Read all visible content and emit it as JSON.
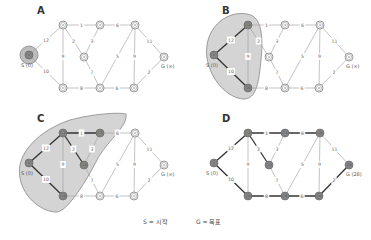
{
  "legend": {
    "start": "S = 시작",
    "goal": "G = 목표"
  },
  "graph": {
    "nodes": [
      {
        "id": "S"
      },
      {
        "id": "N1"
      },
      {
        "id": "N2"
      },
      {
        "id": "N3"
      },
      {
        "id": "M"
      },
      {
        "id": "B1"
      },
      {
        "id": "B2"
      },
      {
        "id": "B3"
      },
      {
        "id": "G"
      }
    ],
    "edges": [
      {
        "from": "S",
        "to": "N1",
        "weight": "12"
      },
      {
        "from": "S",
        "to": "B1",
        "weight": "10"
      },
      {
        "from": "N1",
        "to": "N2",
        "weight": "1"
      },
      {
        "from": "N2",
        "to": "N3",
        "weight": "6"
      },
      {
        "from": "N1",
        "to": "M",
        "weight": "2"
      },
      {
        "from": "N2",
        "to": "M",
        "weight": "3"
      },
      {
        "from": "N1",
        "to": "B1",
        "weight": "9"
      },
      {
        "from": "M",
        "to": "B2",
        "weight": "7"
      },
      {
        "from": "B1",
        "to": "B2",
        "weight": "8"
      },
      {
        "from": "B2",
        "to": "N3",
        "weight": "5"
      },
      {
        "from": "B2",
        "to": "B3",
        "weight": "6"
      },
      {
        "from": "N3",
        "to": "B3",
        "weight": "9"
      },
      {
        "from": "N3",
        "to": "G",
        "weight": "11"
      },
      {
        "from": "B3",
        "to": "G",
        "weight": "2"
      }
    ]
  },
  "panels": [
    {
      "id": "A",
      "label": "A",
      "start_label": "S (0)",
      "goal_label": "G (∞)",
      "node_inner": {
        "S": "0",
        "N1": "∞",
        "N2": "∞",
        "N3": "∞",
        "M": "∞",
        "B1": "∞",
        "B2": "∞",
        "B3": "∞",
        "G": "∞"
      },
      "visited": [
        "S"
      ],
      "bold_edges": [],
      "boxed_edges": [],
      "region": "small"
    },
    {
      "id": "B",
      "label": "B",
      "start_label": "S (0)",
      "goal_label": "G (∞)",
      "node_inner": {
        "S": "0",
        "N1": "12",
        "N2": "∞",
        "N3": "∞",
        "M": "∞",
        "B1": "10",
        "B2": "∞",
        "B3": "∞",
        "G": "∞"
      },
      "visited": [
        "S",
        "N1",
        "B1"
      ],
      "bold_edges": [
        [
          "S",
          "N1"
        ],
        [
          "S",
          "B1"
        ]
      ],
      "boxed_edges": [
        [
          "S",
          "N1"
        ],
        [
          "S",
          "B1"
        ],
        [
          "N1",
          "B1"
        ],
        [
          "N1",
          "M"
        ]
      ],
      "region": "medium"
    },
    {
      "id": "C",
      "label": "C",
      "start_label": "S (0)",
      "goal_label": "G (∞)",
      "node_inner": {
        "S": "0",
        "N1": "12",
        "N2": "13",
        "N3": "∞",
        "M": "14",
        "B1": "10",
        "B2": "∞",
        "B3": "∞",
        "G": "∞"
      },
      "visited": [
        "S",
        "N1",
        "N2",
        "M",
        "B1"
      ],
      "bold_edges": [
        [
          "S",
          "N1"
        ],
        [
          "S",
          "B1"
        ],
        [
          "N1",
          "N2"
        ],
        [
          "N1",
          "M"
        ]
      ],
      "boxed_edges": [
        [
          "S",
          "N1"
        ],
        [
          "S",
          "B1"
        ],
        [
          "N1",
          "B1"
        ],
        [
          "N1",
          "N2"
        ],
        [
          "N1",
          "M"
        ],
        [
          "N2",
          "M"
        ]
      ],
      "region": "large"
    },
    {
      "id": "D",
      "label": "D",
      "start_label": "S (0)",
      "goal_label": "G (28)",
      "node_inner": {
        "S": "0",
        "N1": "12",
        "N2": "13",
        "N3": "19",
        "M": "14",
        "B1": "10",
        "B2": "18",
        "B3": "26",
        "G": "28"
      },
      "visited": [
        "S",
        "N1",
        "N2",
        "N3",
        "M",
        "B1",
        "B2",
        "B3",
        "G"
      ],
      "bold_edges": [
        [
          "S",
          "N1"
        ],
        [
          "S",
          "B1"
        ],
        [
          "N1",
          "N2"
        ],
        [
          "N2",
          "N3"
        ],
        [
          "N1",
          "M"
        ],
        [
          "B1",
          "B2"
        ],
        [
          "B2",
          "B3"
        ],
        [
          "B3",
          "G"
        ]
      ],
      "boxed_edges": [],
      "region": "none"
    }
  ],
  "colors": {
    "edge": "#9a9a9a",
    "bold_edge": "#333333",
    "node_fill": "#ffffff",
    "visited_fill": "#8f8f8f",
    "region_fill": "#d4d4d4",
    "region_stroke": "#7a7a7a",
    "start_halo": "#bdbdbd"
  }
}
